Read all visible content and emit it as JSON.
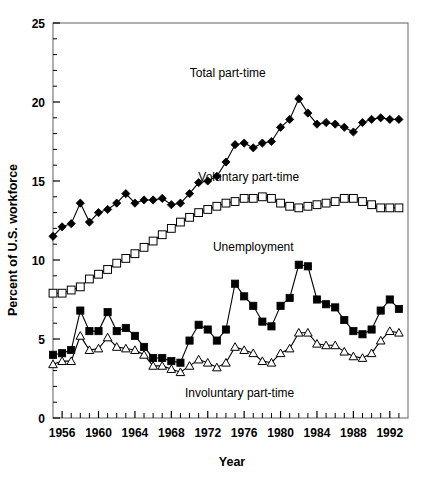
{
  "chart_data": {
    "type": "line",
    "title": "",
    "xlabel": "Year",
    "ylabel": "Percent of U.S. workforce",
    "xlim": [
      1955,
      1994
    ],
    "ylim": [
      0,
      25
    ],
    "yticks": [
      0,
      5,
      10,
      15,
      20,
      25
    ],
    "ytick_labels": [
      "0",
      "5",
      "10",
      "15",
      "20",
      "25"
    ],
    "xticks": [
      1956,
      1960,
      1964,
      1968,
      1972,
      1976,
      1980,
      1984,
      1988,
      1992
    ],
    "xtick_labels": [
      "1956",
      "1960",
      "1964",
      "1968",
      "1972",
      "1976",
      "1980",
      "1984",
      "1988",
      "1992"
    ],
    "x_minor_tick_interval": 1,
    "y_minor_tick_interval": 1,
    "grid": false,
    "legend": "inline-annotations",
    "x": [
      1955,
      1956,
      1957,
      1958,
      1959,
      1960,
      1961,
      1962,
      1963,
      1964,
      1965,
      1966,
      1967,
      1968,
      1969,
      1970,
      1971,
      1972,
      1973,
      1974,
      1975,
      1976,
      1977,
      1978,
      1979,
      1980,
      1981,
      1982,
      1983,
      1984,
      1985,
      1986,
      1987,
      1988,
      1989,
      1990,
      1991,
      1992,
      1993
    ],
    "series": [
      {
        "name": "Total part-time",
        "marker": "filled-diamond",
        "color": "#000000",
        "label_x": 1974.2,
        "label_y": 21.6,
        "values": [
          11.5,
          12.1,
          12.3,
          13.6,
          12.4,
          13.0,
          13.2,
          13.6,
          14.2,
          13.6,
          13.8,
          13.8,
          13.9,
          13.5,
          13.6,
          14.2,
          14.9,
          15.0,
          15.3,
          16.2,
          17.3,
          17.4,
          17.1,
          17.4,
          17.5,
          18.4,
          18.9,
          20.2,
          19.3,
          18.6,
          18.7,
          18.6,
          18.4,
          18.1,
          18.7,
          18.9,
          19.0,
          18.9,
          18.9
        ]
      },
      {
        "name": "Voluntary part-time",
        "marker": "open-square",
        "color": "#000000",
        "label_x": 1976.5,
        "label_y": 15.0,
        "values": [
          7.9,
          7.9,
          8.1,
          8.3,
          8.8,
          9.1,
          9.4,
          9.8,
          10.1,
          10.4,
          10.8,
          11.2,
          11.6,
          12.0,
          12.4,
          12.7,
          13.0,
          13.2,
          13.4,
          13.6,
          13.7,
          13.9,
          13.9,
          14.0,
          13.9,
          13.6,
          13.4,
          13.3,
          13.4,
          13.5,
          13.6,
          13.7,
          13.9,
          13.9,
          13.7,
          13.5,
          13.3,
          13.3,
          13.3
        ]
      },
      {
        "name": "Unemployment",
        "marker": "filled-square",
        "color": "#000000",
        "label_x": 1977.0,
        "label_y": 10.6,
        "values": [
          4.0,
          4.1,
          4.3,
          6.8,
          5.5,
          5.5,
          6.7,
          5.5,
          5.7,
          5.2,
          4.5,
          3.8,
          3.8,
          3.6,
          3.5,
          4.9,
          5.9,
          5.6,
          4.9,
          5.6,
          8.5,
          7.7,
          7.1,
          6.1,
          5.8,
          7.1,
          7.6,
          9.7,
          9.6,
          7.5,
          7.2,
          7.0,
          6.2,
          5.5,
          5.3,
          5.6,
          6.8,
          7.5,
          6.9
        ]
      },
      {
        "name": "Involuntary part-time",
        "marker": "open-triangle",
        "color": "#000000",
        "label_x": 1975.5,
        "label_y": 1.35,
        "values": [
          3.4,
          3.6,
          3.6,
          5.2,
          4.3,
          4.4,
          5.1,
          4.5,
          4.4,
          4.3,
          4.0,
          3.3,
          3.3,
          3.1,
          2.9,
          3.3,
          3.7,
          3.5,
          3.2,
          3.5,
          4.5,
          4.3,
          4.1,
          3.6,
          3.5,
          4.1,
          4.4,
          5.4,
          5.4,
          4.7,
          4.6,
          4.6,
          4.2,
          3.9,
          3.8,
          4.1,
          4.9,
          5.5,
          5.4
        ]
      }
    ]
  },
  "axis": {
    "y_title": "Percent of U.S. workforce",
    "x_title": "Year"
  }
}
